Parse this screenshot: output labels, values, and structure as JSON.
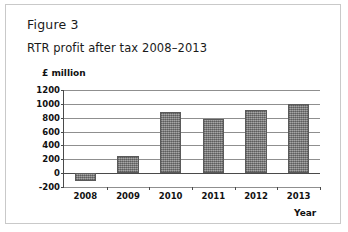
{
  "figure": {
    "label": "Figure 3",
    "frame_color": "#c9c9c9",
    "background": "#ffffff"
  },
  "chart_data": {
    "type": "bar",
    "title": "RTR profit after tax 2008–2013",
    "xlabel": "Year",
    "ylabel": "£ million",
    "categories": [
      "2008",
      "2009",
      "2010",
      "2011",
      "2012",
      "2013"
    ],
    "values": [
      -120,
      250,
      880,
      780,
      910,
      1000
    ],
    "ylim": [
      -200,
      1200
    ],
    "yticks": [
      1200,
      1000,
      800,
      600,
      400,
      200,
      0,
      -200
    ],
    "ytick_labels": [
      "1200",
      "1000",
      "800",
      "600",
      "400",
      "200",
      "0",
      "-200"
    ],
    "grid": true,
    "legend": false,
    "bar_color": "#8e8e8e",
    "bar_edge_color": "#5a5a5a",
    "axis_color": "#4a4a4a",
    "gridline_color": "#8f8f8f"
  }
}
